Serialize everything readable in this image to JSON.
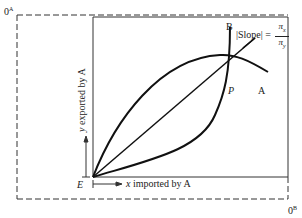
{
  "diagram": {
    "origin_A_label": "0",
    "origin_A_sup": "A",
    "origin_B_label": "0",
    "origin_B_sup": "B",
    "endowment_label": "E",
    "point_label": "P",
    "curve_A_label": "A",
    "curve_B_label": "B",
    "slope_label": "|Slope| =",
    "slope_numerator": "π",
    "slope_numerator_sub": "x",
    "slope_denominator": "π",
    "slope_denominator_sub": "y",
    "x_axis_label_var": "x",
    "x_axis_label_rest": " imported by A",
    "y_axis_label_var": "y",
    "y_axis_label_rest": " exported by A"
  },
  "colors": {
    "ink": "#222222",
    "background": "#ffffff"
  }
}
